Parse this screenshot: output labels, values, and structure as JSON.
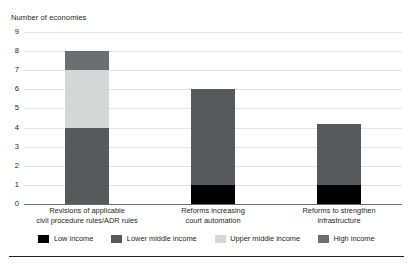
{
  "chart_data": {
    "type": "bar",
    "subtype": "stacked-column",
    "title": "",
    "xlabel": "",
    "ylabel": "Number of economies",
    "ylim": [
      0,
      9
    ],
    "yticks": [
      "0",
      "1",
      "2",
      "3",
      "4",
      "5",
      "6",
      "7",
      "8",
      "9"
    ],
    "grid": true,
    "legend_position": "bottom",
    "categories": [
      "Revisions of applicable civil procedure rules/ADR rules",
      "Reforms increasing court automation",
      "Reforms to strengthen infrastructure"
    ],
    "category_lines": [
      [
        "Revisions of applicable",
        "civil procedure rules/ADR rules"
      ],
      [
        "Reforms increasing",
        "court automation"
      ],
      [
        "Reforms to strengthen",
        "infrastructure"
      ]
    ],
    "series": [
      {
        "name": "Low income",
        "color": "#000000",
        "values": [
          0,
          1,
          1
        ]
      },
      {
        "name": "Lower middle income",
        "color": "#58595b",
        "values": [
          4,
          5,
          3.2
        ]
      },
      {
        "name": "Upper middle income",
        "color": "#d5d6d6",
        "values": [
          3,
          0,
          0
        ]
      },
      {
        "name": "High income",
        "color": "#6d6e71",
        "values": [
          1,
          0,
          0
        ]
      }
    ],
    "totals": [
      8,
      6,
      4.2
    ]
  },
  "axis": {
    "title": "Number of economies"
  }
}
